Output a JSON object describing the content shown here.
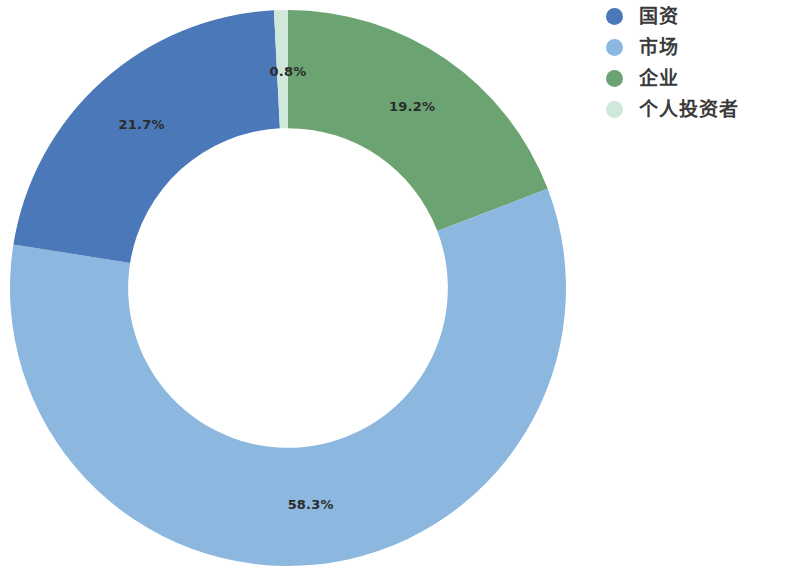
{
  "chart_data": {
    "type": "pie",
    "variant": "donut",
    "title": "",
    "subtitle": "",
    "xlabel": "",
    "ylabel": "",
    "grid": false,
    "legend_position": "right",
    "hole_ratio": 0.575,
    "start_angle_deg": 0,
    "direction": "clockwise",
    "labels": [
      "国资",
      "市场",
      "企业",
      "个人投资者"
    ],
    "values": [
      21.7,
      58.3,
      19.2,
      0.8
    ],
    "value_unit": "%",
    "colors": [
      "#4a78b8",
      "#8cb8e0",
      "#6ba372",
      "#cfe8d9"
    ],
    "slices": [
      {
        "label": "企业",
        "value": 19.2,
        "value_text": "19.2%",
        "color": "#6ba372",
        "start_deg": 0.0,
        "end_deg": 69.1,
        "show_label": true
      },
      {
        "label": "市场",
        "value": 58.3,
        "value_text": "58.3%",
        "color": "#8cb8e0",
        "start_deg": 69.1,
        "end_deg": 279.0,
        "show_label": true
      },
      {
        "label": "国资",
        "value": 21.7,
        "value_text": "21.7%",
        "color": "#4a78b8",
        "start_deg": 279.0,
        "end_deg": 357.1,
        "show_label": true
      },
      {
        "label": "个人投资者",
        "value": 0.8,
        "value_text": "0.8%",
        "color": "#cfe8d9",
        "start_deg": 357.1,
        "end_deg": 360.0,
        "show_label": false
      }
    ],
    "annotations": [
      {
        "text": "0.8%",
        "x": 288,
        "y": 72
      }
    ]
  },
  "legend": {
    "items": [
      {
        "label": "国资",
        "color": "#4a78b8"
      },
      {
        "label": "市场",
        "color": "#8cb8e0"
      },
      {
        "label": "企业",
        "color": "#6ba372"
      },
      {
        "label": "个人投资者",
        "color": "#cfe8d9"
      }
    ]
  }
}
